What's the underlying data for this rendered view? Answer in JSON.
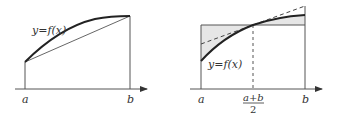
{
  "left_figure": {
    "curve_label": "y=f(x)",
    "x_labels": {
      "a": "a",
      "b": "b"
    },
    "description": "Concave curve y=f(x) from a to b with chord connecting endpoints (trapezoid rule)"
  },
  "right_figure": {
    "curve_label": "y=f(x)",
    "x_labels": {
      "a": "a",
      "mid_numerator": "a+b",
      "mid_denominator": "2",
      "b": "b"
    },
    "description": "Concave curve with midpoint rectangle (shaded gaps) and dashed tangent line at (a+b)/2"
  },
  "colors": {
    "stroke": "#333333",
    "thin": "#555555",
    "shade": "#e6e6e6",
    "background": "#ffffff"
  }
}
